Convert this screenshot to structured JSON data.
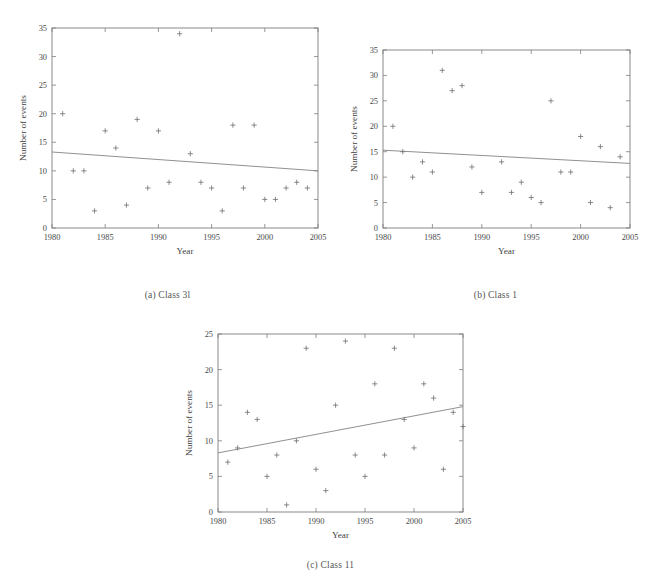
{
  "figure": {
    "background_color": "#ffffff",
    "axis_color": "#7d7d7d",
    "marker_color": "#6f6f6f",
    "trend_color": "#8a8a8a",
    "text_color": "#4a4a4a"
  },
  "panels": [
    {
      "id": "a",
      "caption": "(a)  Class 3l",
      "chart_data": {
        "type": "scatter",
        "title": "",
        "xlabel": "Year",
        "ylabel": "Number of events",
        "xlim": [
          1980,
          2005
        ],
        "ylim": [
          0,
          35
        ],
        "xticks": [
          1980,
          1985,
          1990,
          1995,
          2000,
          2005
        ],
        "yticks": [
          0,
          5,
          10,
          15,
          20,
          25,
          30,
          35
        ],
        "grid": false,
        "legend": "none",
        "marker": "plus",
        "x": [
          1981,
          1982,
          1983,
          1984,
          1985,
          1986,
          1987,
          1988,
          1989,
          1990,
          1991,
          1992,
          1993,
          1994,
          1995,
          1996,
          1997,
          1998,
          1999,
          2000,
          2001,
          2002,
          2003,
          2004
        ],
        "y": [
          20,
          10,
          10,
          3,
          17,
          14,
          4,
          19,
          7,
          17,
          8,
          34,
          13,
          8,
          7,
          3,
          18,
          7,
          18,
          5,
          5,
          7,
          8,
          7
        ],
        "trend": {
          "type": "line",
          "x": [
            1980,
            2005
          ],
          "y": [
            13.3,
            10.0
          ]
        }
      }
    },
    {
      "id": "b",
      "caption": "(b)  Class 1",
      "chart_data": {
        "type": "scatter",
        "title": "",
        "xlabel": "Year",
        "ylabel": "Number of events",
        "xlim": [
          1980,
          2005
        ],
        "ylim": [
          0,
          35
        ],
        "xticks": [
          1980,
          1985,
          1990,
          1995,
          2000,
          2005
        ],
        "yticks": [
          0,
          5,
          10,
          15,
          20,
          25,
          30,
          35
        ],
        "grid": false,
        "legend": "none",
        "marker": "plus",
        "x": [
          1981,
          1982,
          1983,
          1984,
          1985,
          1986,
          1987,
          1988,
          1989,
          1990,
          1992,
          1993,
          1994,
          1995,
          1996,
          1997,
          1998,
          1999,
          2000,
          2001,
          2002,
          2003,
          2004
        ],
        "y": [
          20,
          15,
          10,
          13,
          11,
          31,
          27,
          28,
          12,
          7,
          13,
          7,
          9,
          6,
          5,
          25,
          11,
          11,
          18,
          5,
          16,
          4,
          14
        ],
        "trend": {
          "type": "line",
          "x": [
            1980,
            2005
          ],
          "y": [
            15.3,
            12.7
          ]
        }
      }
    },
    {
      "id": "c",
      "caption": "(c)  Class 11",
      "chart_data": {
        "type": "scatter",
        "title": "",
        "xlabel": "Year",
        "ylabel": "Number of events",
        "xlim": [
          1980,
          2005
        ],
        "ylim": [
          0,
          25
        ],
        "xticks": [
          1980,
          1985,
          1990,
          1995,
          2000,
          2005
        ],
        "yticks": [
          0,
          5,
          10,
          15,
          20,
          25
        ],
        "grid": false,
        "legend": "none",
        "marker": "plus",
        "x": [
          1981,
          1982,
          1983,
          1984,
          1985,
          1986,
          1987,
          1988,
          1989,
          1990,
          1991,
          1992,
          1993,
          1994,
          1995,
          1996,
          1997,
          1998,
          1999,
          2000,
          2001,
          2002,
          2003,
          2004,
          2005
        ],
        "y": [
          7,
          9,
          14,
          13,
          5,
          8,
          1,
          10,
          23,
          6,
          3,
          15,
          24,
          8,
          5,
          18,
          8,
          23,
          13,
          9,
          18,
          16,
          6,
          14,
          12
        ],
        "trend": {
          "type": "line",
          "x": [
            1980,
            2005
          ],
          "y": [
            8.3,
            14.8
          ]
        }
      }
    }
  ]
}
